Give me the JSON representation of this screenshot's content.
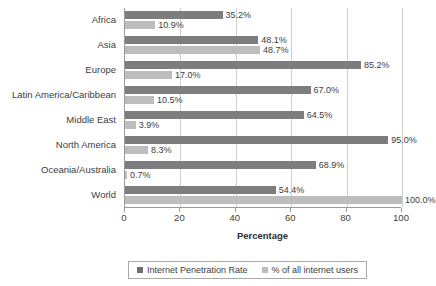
{
  "chart_data": {
    "type": "bar",
    "orientation": "horizontal",
    "title": "",
    "xlabel": "Percentage",
    "ylabel": "",
    "xlim": [
      0,
      100
    ],
    "xticks": [
      "0",
      "20",
      "40",
      "60",
      "80",
      "100"
    ],
    "grid": true,
    "legend_position": "bottom",
    "categories": [
      "Africa",
      "Asia",
      "Europe",
      "Latin America/Caribbean",
      "Middle East",
      "North America",
      "Oceania/Australia",
      "World"
    ],
    "series": [
      {
        "name": "Internet Penetration Rate",
        "color": "#7d7d7d",
        "values": [
          35.2,
          48.1,
          85.2,
          67.0,
          64.5,
          95.0,
          68.9,
          54.4
        ],
        "labels": [
          "35.2%",
          "48.1%",
          "85.2%",
          "67.0%",
          "64.5%",
          "95.0%",
          "68.9%",
          "54.4%"
        ]
      },
      {
        "name": "% of all internet users",
        "color": "#bdbdbd",
        "values": [
          10.9,
          48.7,
          17.0,
          10.5,
          3.9,
          8.3,
          0.7,
          100.0
        ],
        "labels": [
          "10.9%",
          "48.7%",
          "17.0%",
          "10.5%",
          "3.9%",
          "8.3%",
          "0.7%",
          "100.0%"
        ]
      }
    ]
  },
  "legend": {
    "items": [
      {
        "label": "Internet Penetration Rate"
      },
      {
        "label": "% of all internet users"
      }
    ]
  },
  "axis": {
    "x_title": "Percentage"
  },
  "colors": {
    "series0": "#7d7d7d",
    "series1": "#bdbdbd",
    "gridline": "#cfcfcf",
    "axis": "#9a9a9a",
    "text": "#3d3d3d",
    "background": "#ffffff"
  }
}
